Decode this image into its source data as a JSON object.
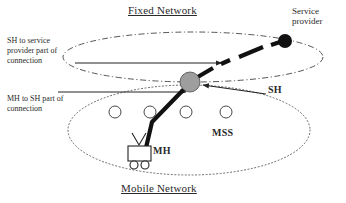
{
  "figure": {
    "title_top": "Fixed Network",
    "title_bottom": "Mobile Network",
    "background_color": "#ffffff",
    "ink_color": "#1a1a1a"
  },
  "labels": {
    "fixed_network": "Fixed Network",
    "mobile_network": "Mobile Network",
    "service_provider": "Service\nprovider",
    "sh_to_service_provider": "SH to service\nprovider part of\nconnection",
    "mh_to_sh": "MH to SH part of\nconnection",
    "sh": "SH",
    "mh": "MH",
    "mss": "MSS"
  },
  "nodes": {
    "service_provider_node": {
      "name": "service-provider-node",
      "shape": "filled-circle",
      "color": "#111111",
      "cx": 285,
      "cy": 41,
      "r": 7
    },
    "sh_node": {
      "name": "sh-node",
      "shape": "filled-circle",
      "color": "#9e9e9e",
      "stroke": "#444444",
      "cx": 190,
      "cy": 82,
      "r": 10
    },
    "mss_nodes": [
      {
        "name": "mss-node-1",
        "cx": 115,
        "cy": 112,
        "r": 6
      },
      {
        "name": "mss-node-2",
        "cx": 150,
        "cy": 112,
        "r": 6
      },
      {
        "name": "mss-node-3",
        "cx": 186,
        "cy": 112,
        "r": 6
      },
      {
        "name": "mss-node-4",
        "cx": 226,
        "cy": 112,
        "r": 6
      }
    ],
    "mobile_host": {
      "name": "mobile-host-cart",
      "body": {
        "x": 128,
        "y": 146,
        "w": 22,
        "h": 15
      },
      "wheels": [
        {
          "cx": 134,
          "cy": 165,
          "r": 4
        },
        {
          "cx": 145,
          "cy": 165,
          "r": 4
        }
      ],
      "antenna_apex": {
        "x": 139,
        "y": 146
      }
    }
  },
  "regions": {
    "fixed_network_ellipse": {
      "name": "fixed-network-boundary",
      "cx": 193,
      "cy": 57,
      "rx": 130,
      "ry": 25,
      "stroke_style": "dash-dot"
    },
    "mobile_network_ellipse": {
      "name": "mobile-network-boundary",
      "cx": 189,
      "cy": 130,
      "rx": 121,
      "ry": 45,
      "stroke_style": "dotted"
    }
  },
  "connections": {
    "sh_to_sp_arrow": {
      "name": "sh-to-service-provider-arrow",
      "from": {
        "x": 75,
        "y": 63
      },
      "to": {
        "x": 222,
        "y": 63
      },
      "style": "thin-solid-arrow"
    },
    "mh_to_sh_arrow": {
      "name": "mh-to-sh-arrow",
      "from": {
        "x": 58,
        "y": 92
      },
      "to": {
        "x": 186,
        "y": 92
      },
      "style": "thin-solid-arrow"
    },
    "sh_callout_arrow": {
      "name": "sh-callout-arrow",
      "from": {
        "x": 266,
        "y": 94
      },
      "to": {
        "x": 203,
        "y": 85
      },
      "style": "thin-solid-arrow"
    },
    "thick_connection_path": {
      "name": "mh-to-service-provider-thick-path",
      "style": "thick-dashed",
      "segments": [
        {
          "x1": 145,
          "y1": 150,
          "x2": 152,
          "y2": 122
        },
        {
          "x1": 152,
          "y1": 122,
          "x2": 186,
          "y2": 86
        },
        {
          "x1": 196,
          "y1": 78,
          "x2": 212,
          "y2": 68
        },
        {
          "x1": 220,
          "y1": 64,
          "x2": 229,
          "y2": 60
        },
        {
          "x1": 238,
          "y1": 57,
          "x2": 262,
          "y2": 48
        },
        {
          "x1": 270,
          "y1": 46,
          "x2": 279,
          "y2": 43
        }
      ]
    }
  }
}
